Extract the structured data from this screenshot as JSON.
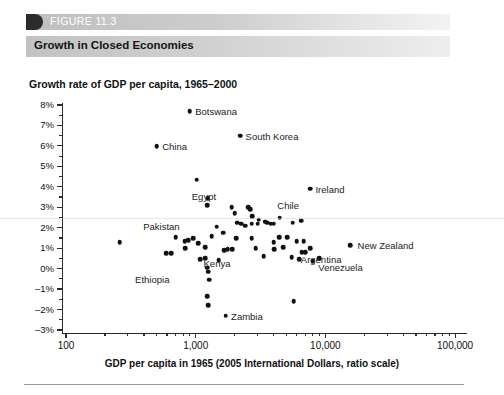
{
  "figure": {
    "label": "FIGURE 11.3",
    "title": "Growth in Closed Economies"
  },
  "chart_data": {
    "type": "scatter",
    "title": "Growth rate of GDP per capita, 1965–2000",
    "xlabel": "GDP per capita in 1965 (2005 International Dollars, ratio scale)",
    "ylabel": "Growth rate of GDP per capita, 1965–2000",
    "xscale": "log",
    "xlim": [
      100,
      200000
    ],
    "ylim": [
      -3,
      8
    ],
    "grid": false,
    "legend": null,
    "x_ticks": [
      {
        "value": 100,
        "label": "100"
      },
      {
        "value": 1000,
        "label": "1,000"
      },
      {
        "value": 10000,
        "label": "10,000"
      },
      {
        "value": 100000,
        "label": "100,000"
      }
    ],
    "y_ticks": [
      {
        "value": 8,
        "label": "8%"
      },
      {
        "value": 7,
        "label": "7%"
      },
      {
        "value": 6,
        "label": "6%"
      },
      {
        "value": 5,
        "label": "5%"
      },
      {
        "value": 4,
        "label": "4%"
      },
      {
        "value": 3,
        "label": "3%"
      },
      {
        "value": 2,
        "label": "2%"
      },
      {
        "value": 1,
        "label": "1%"
      },
      {
        "value": 0,
        "label": "0%"
      },
      {
        "value": -1,
        "label": "–1%"
      },
      {
        "value": -2,
        "label": "–2%"
      },
      {
        "value": -3,
        "label": "–3%"
      }
    ],
    "labeled_points": [
      {
        "name": "Botswana",
        "x": 900,
        "y": 7.7,
        "side": "right"
      },
      {
        "name": "South Korea",
        "x": 2200,
        "y": 6.5,
        "side": "right"
      },
      {
        "name": "China",
        "x": 500,
        "y": 6.0,
        "side": "right"
      },
      {
        "name": "Ireland",
        "x": 7600,
        "y": 3.9,
        "side": "right"
      },
      {
        "name": "Egypt",
        "x": 1250,
        "y": 3.0,
        "side": "right"
      },
      {
        "name": "Chile",
        "x": 4300,
        "y": 2.6,
        "side": "right"
      },
      {
        "name": "Pakistan",
        "x": 1000,
        "y": 2.1,
        "side": "right"
      },
      {
        "name": "New Zealand",
        "x": 15500,
        "y": 1.15,
        "side": "right"
      },
      {
        "name": "Argentina",
        "x": 7000,
        "y": 0.8,
        "side": "right"
      },
      {
        "name": "Venezuela",
        "x": 8000,
        "y": 0.35,
        "side": "right"
      },
      {
        "name": "Kenya",
        "x": 1080,
        "y": 0.45,
        "side": "right"
      },
      {
        "name": "Ethiopia",
        "x": 700,
        "y": 0.1,
        "side": "right"
      },
      {
        "name": "Zambia",
        "x": 1700,
        "y": -2.3,
        "side": "right"
      }
    ],
    "points": [
      {
        "x": 900,
        "y": 7.7
      },
      {
        "x": 2200,
        "y": 6.5
      },
      {
        "x": 500,
        "y": 6.0
      },
      {
        "x": 1020,
        "y": 4.35
      },
      {
        "x": 1240,
        "y": 3.45
      },
      {
        "x": 1230,
        "y": 3.1
      },
      {
        "x": 1900,
        "y": 3.0
      },
      {
        "x": 2000,
        "y": 2.7
      },
      {
        "x": 2550,
        "y": 3.0
      },
      {
        "x": 2640,
        "y": 2.9
      },
      {
        "x": 2720,
        "y": 2.55
      },
      {
        "x": 7600,
        "y": 3.9
      },
      {
        "x": 3050,
        "y": 2.4
      },
      {
        "x": 2080,
        "y": 2.25
      },
      {
        "x": 2250,
        "y": 2.2
      },
      {
        "x": 2420,
        "y": 2.1
      },
      {
        "x": 2700,
        "y": 2.2
      },
      {
        "x": 3000,
        "y": 2.2
      },
      {
        "x": 3450,
        "y": 2.3
      },
      {
        "x": 3550,
        "y": 2.25
      },
      {
        "x": 3800,
        "y": 2.2
      },
      {
        "x": 4000,
        "y": 2.2
      },
      {
        "x": 4450,
        "y": 2.5
      },
      {
        "x": 5600,
        "y": 2.25
      },
      {
        "x": 6500,
        "y": 2.35
      },
      {
        "x": 1450,
        "y": 2.05
      },
      {
        "x": 1630,
        "y": 1.75
      },
      {
        "x": 1330,
        "y": 1.6
      },
      {
        "x": 2050,
        "y": 1.5
      },
      {
        "x": 2700,
        "y": 1.5
      },
      {
        "x": 4400,
        "y": 1.55
      },
      {
        "x": 5100,
        "y": 1.55
      },
      {
        "x": 4000,
        "y": 1.3
      },
      {
        "x": 6000,
        "y": 1.35
      },
      {
        "x": 6800,
        "y": 1.35
      },
      {
        "x": 260,
        "y": 1.3
      },
      {
        "x": 700,
        "y": 1.55
      },
      {
        "x": 820,
        "y": 1.35
      },
      {
        "x": 880,
        "y": 1.4
      },
      {
        "x": 960,
        "y": 1.5
      },
      {
        "x": 1050,
        "y": 1.25
      },
      {
        "x": 15500,
        "y": 1.15
      },
      {
        "x": 830,
        "y": 1.0
      },
      {
        "x": 1180,
        "y": 1.05
      },
      {
        "x": 1650,
        "y": 0.9
      },
      {
        "x": 1760,
        "y": 0.95
      },
      {
        "x": 1920,
        "y": 0.95
      },
      {
        "x": 2900,
        "y": 1.0
      },
      {
        "x": 4050,
        "y": 0.95
      },
      {
        "x": 4750,
        "y": 1.05
      },
      {
        "x": 7600,
        "y": 1.0
      },
      {
        "x": 590,
        "y": 0.75
      },
      {
        "x": 650,
        "y": 0.75
      },
      {
        "x": 1180,
        "y": 0.5
      },
      {
        "x": 1080,
        "y": 0.45
      },
      {
        "x": 1500,
        "y": 0.4
      },
      {
        "x": 5500,
        "y": 0.55
      },
      {
        "x": 9000,
        "y": 0.5
      },
      {
        "x": 3350,
        "y": 0.6
      },
      {
        "x": 1230,
        "y": 0.05
      },
      {
        "x": 1250,
        "y": -0.15
      },
      {
        "x": 6300,
        "y": 0.45
      },
      {
        "x": 7000,
        "y": 0.8
      },
      {
        "x": 6550,
        "y": 0.8
      },
      {
        "x": 8000,
        "y": 0.35
      },
      {
        "x": 1270,
        "y": -0.55
      },
      {
        "x": 1230,
        "y": -1.35
      },
      {
        "x": 1250,
        "y": -1.8
      },
      {
        "x": 5700,
        "y": -1.6
      },
      {
        "x": 1700,
        "y": -2.3
      }
    ]
  }
}
